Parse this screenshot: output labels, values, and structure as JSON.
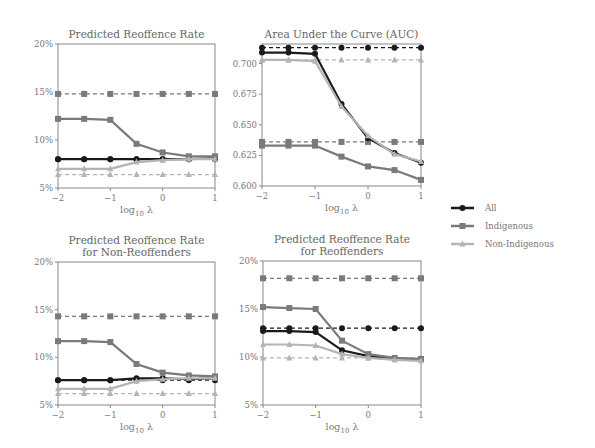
{
  "chart_data": [
    {
      "type": "line",
      "title": "Predicted Reoffence Rate",
      "xlabel": "log10 λ",
      "ylabel": "",
      "x": [
        -2,
        -1.5,
        -1,
        -0.5,
        0,
        0.5,
        1
      ],
      "xticks": [
        "−2",
        "−1",
        "0",
        "1"
      ],
      "ylim": [
        5,
        20
      ],
      "yticks": [
        "5%",
        "10%",
        "15%",
        "20%"
      ],
      "series": [
        {
          "name": "All",
          "style": "solid",
          "values": [
            8.0,
            8.0,
            8.0,
            8.0,
            8.0,
            8.0,
            8.1
          ]
        },
        {
          "name": "Indigenous",
          "style": "solid",
          "values": [
            12.2,
            12.2,
            12.1,
            9.6,
            8.7,
            8.3,
            8.3
          ]
        },
        {
          "name": "Non-Indigenous",
          "style": "solid",
          "values": [
            7.0,
            7.0,
            7.0,
            7.7,
            7.9,
            8.0,
            8.0
          ]
        },
        {
          "name": "All (baseline)",
          "style": "dashed",
          "values": [
            8.0,
            8.0,
            8.0,
            8.0,
            8.0,
            8.0,
            8.0
          ]
        },
        {
          "name": "Indigenous (baseline)",
          "style": "dashed",
          "values": [
            14.8,
            14.8,
            14.8,
            14.8,
            14.8,
            14.8,
            14.8
          ]
        },
        {
          "name": "Non-Indigenous (baseline)",
          "style": "dashed",
          "values": [
            6.4,
            6.4,
            6.4,
            6.4,
            6.4,
            6.4,
            6.4
          ]
        }
      ]
    },
    {
      "type": "line",
      "title": "Area Under the Curve (AUC)",
      "xlabel": "log10 λ",
      "ylabel": "",
      "x": [
        -2,
        -1.5,
        -1,
        -0.5,
        0,
        0.5,
        1
      ],
      "xticks": [
        "−2",
        "−1",
        "0",
        "1"
      ],
      "ylim": [
        0.6,
        0.716
      ],
      "yticks": [
        "0.600",
        "0.625",
        "0.650",
        "0.675",
        "0.700"
      ],
      "series": [
        {
          "name": "All",
          "style": "solid",
          "values": [
            0.709,
            0.709,
            0.708,
            0.667,
            0.639,
            0.627,
            0.619
          ]
        },
        {
          "name": "Indigenous",
          "style": "solid",
          "values": [
            0.633,
            0.633,
            0.633,
            0.624,
            0.616,
            0.613,
            0.605
          ]
        },
        {
          "name": "Non-Indigenous",
          "style": "solid",
          "values": [
            0.703,
            0.703,
            0.702,
            0.665,
            0.641,
            0.626,
            0.62
          ]
        },
        {
          "name": "All (baseline)",
          "style": "dashed",
          "values": [
            0.713,
            0.713,
            0.713,
            0.713,
            0.713,
            0.713,
            0.713
          ]
        },
        {
          "name": "Indigenous (baseline)",
          "style": "dashed",
          "values": [
            0.636,
            0.636,
            0.636,
            0.636,
            0.636,
            0.636,
            0.636
          ]
        },
        {
          "name": "Non-Indigenous (baseline)",
          "style": "dashed",
          "values": [
            0.703,
            0.703,
            0.703,
            0.703,
            0.703,
            0.703,
            0.703
          ]
        }
      ]
    },
    {
      "type": "line",
      "title": "Predicted Reoffence Rate for Non-Reoffenders",
      "title_lines": [
        "Predicted Reoffence Rate",
        "for Non-Reoffenders"
      ],
      "xlabel": "log10 λ",
      "ylabel": "",
      "x": [
        -2,
        -1.5,
        -1,
        -0.5,
        0,
        0.5,
        1
      ],
      "xticks": [
        "−2",
        "−1",
        "0",
        "1"
      ],
      "ylim": [
        5,
        20
      ],
      "yticks": [
        "5%",
        "10%",
        "15%",
        "20%"
      ],
      "series": [
        {
          "name": "All",
          "style": "solid",
          "values": [
            7.6,
            7.6,
            7.6,
            7.8,
            7.8,
            7.7,
            7.8
          ]
        },
        {
          "name": "Indigenous",
          "style": "solid",
          "values": [
            11.7,
            11.7,
            11.6,
            9.3,
            8.4,
            8.1,
            8.0
          ]
        },
        {
          "name": "Non-Indigenous",
          "style": "solid",
          "values": [
            6.7,
            6.7,
            6.7,
            7.5,
            7.7,
            7.8,
            7.8
          ]
        },
        {
          "name": "All (baseline)",
          "style": "dashed",
          "values": [
            7.6,
            7.6,
            7.6,
            7.6,
            7.6,
            7.6,
            7.6
          ]
        },
        {
          "name": "Indigenous (baseline)",
          "style": "dashed",
          "values": [
            14.3,
            14.3,
            14.3,
            14.3,
            14.3,
            14.3,
            14.3
          ]
        },
        {
          "name": "Non-Indigenous (baseline)",
          "style": "dashed",
          "values": [
            6.2,
            6.2,
            6.2,
            6.2,
            6.2,
            6.2,
            6.2
          ]
        }
      ]
    },
    {
      "type": "line",
      "title": "Predicted Reoffence Rate for Reoffenders",
      "title_lines": [
        "Predicted Reoffence Rate",
        "for Reoffenders"
      ],
      "xlabel": "log10 λ",
      "ylabel": "",
      "x": [
        -2,
        -1.5,
        -1,
        -0.5,
        0,
        0.5,
        1
      ],
      "xticks": [
        "−2",
        "−1",
        "0",
        "1"
      ],
      "ylim": [
        5,
        20
      ],
      "yticks": [
        "5%",
        "10%",
        "15%",
        "20%"
      ],
      "series": [
        {
          "name": "All",
          "style": "solid",
          "values": [
            12.7,
            12.7,
            12.6,
            10.7,
            10.1,
            9.8,
            9.7
          ]
        },
        {
          "name": "Indigenous",
          "style": "solid",
          "values": [
            15.2,
            15.1,
            15.0,
            11.7,
            10.3,
            9.9,
            9.8
          ]
        },
        {
          "name": "Non-Indigenous",
          "style": "solid",
          "values": [
            11.3,
            11.3,
            11.2,
            10.3,
            9.9,
            9.7,
            9.6
          ]
        },
        {
          "name": "All (baseline)",
          "style": "dashed",
          "values": [
            13.0,
            13.0,
            13.0,
            13.0,
            13.0,
            13.0,
            13.0
          ]
        },
        {
          "name": "Indigenous (baseline)",
          "style": "dashed",
          "values": [
            18.2,
            18.2,
            18.2,
            18.2,
            18.2,
            18.2,
            18.2
          ]
        },
        {
          "name": "Non-Indigenous (baseline)",
          "style": "dashed",
          "values": [
            9.9,
            9.9,
            9.9,
            9.9,
            9.9,
            9.9,
            9.9
          ]
        }
      ]
    }
  ],
  "legend": {
    "position": "right",
    "items": [
      {
        "label": "All",
        "color": "#1a1a1a",
        "marker": "circle"
      },
      {
        "label": "Indigenous",
        "color": "#7a7a7a",
        "marker": "square"
      },
      {
        "label": "Non-Indigenous",
        "color": "#b4b4b4",
        "marker": "triangle"
      }
    ]
  },
  "colors": {
    "All": "#1a1a1a",
    "Indigenous": "#7a7a7a",
    "Non-Indigenous": "#b4b4b4",
    "axis": "#888888"
  }
}
